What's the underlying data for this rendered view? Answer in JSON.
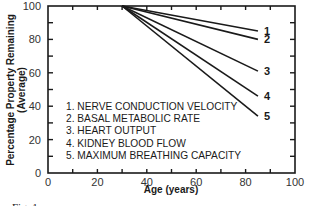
{
  "chart_data": {
    "type": "line",
    "title": "",
    "xlabel": "Age (years)",
    "ylabel": "Percentage Property Remaining (Average)",
    "ylabel_lines": [
      "Percentage Property Remaining",
      "(Average)"
    ],
    "xlim": [
      0,
      100
    ],
    "ylim": [
      0,
      100
    ],
    "x_ticks": [
      0,
      20,
      40,
      60,
      80,
      100
    ],
    "y_ticks": [
      0,
      20,
      40,
      60,
      80,
      100
    ],
    "x_minor_ticks": [
      10,
      30,
      50,
      70,
      90
    ],
    "y_minor_ticks": [
      10,
      30,
      50,
      70,
      90
    ],
    "grid": false,
    "legend_position": "inside lower-left",
    "series": [
      {
        "id": "1",
        "name": "NERVE CONDUCTION VELOCITY",
        "x": [
          30,
          85
        ],
        "y": [
          100,
          85
        ]
      },
      {
        "id": "2",
        "name": "BASAL METABOLIC RATE",
        "x": [
          30,
          85
        ],
        "y": [
          100,
          80
        ]
      },
      {
        "id": "3",
        "name": "HEART OUTPUT",
        "x": [
          30,
          85
        ],
        "y": [
          100,
          61
        ]
      },
      {
        "id": "4",
        "name": "KIDNEY BLOOD FLOW",
        "x": [
          30,
          85
        ],
        "y": [
          100,
          46
        ]
      },
      {
        "id": "5",
        "name": "MAXIMUM BREATHING CAPACITY",
        "x": [
          30,
          85
        ],
        "y": [
          100,
          34
        ]
      }
    ],
    "legend": [
      "1.  NERVE CONDUCTION VELOCITY",
      "2.  BASAL METABOLIC RATE",
      "3.  HEART OUTPUT",
      "4.  KIDNEY BLOOD FLOW",
      "5.  MAXIMUM BREATHING CAPACITY"
    ],
    "caption_partial": "Fig. 1. ..."
  },
  "colors": {
    "line": "#1a1a1a",
    "axis": "#1a1a1a",
    "background": "#ffffff"
  }
}
